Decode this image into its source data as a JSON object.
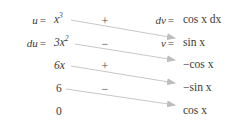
{
  "diagram": {
    "type": "integration-by-parts-table",
    "arrow_count": 4,
    "arrow_color": "#b9b9b9",
    "text_color": "#3a3a3a",
    "background": "#ffffff"
  },
  "labels": {
    "u": "u",
    "du": "du",
    "dv": "dv",
    "v": "v",
    "equals": "="
  },
  "derivative_column": {
    "header_label": "u",
    "entries": [
      {
        "text": "x",
        "exponent": "3",
        "display": "x³"
      },
      {
        "text": "3x",
        "exponent": "2",
        "display": "3x²"
      },
      {
        "text": "6x",
        "exponent": "",
        "display": "6x"
      },
      {
        "text": "6",
        "exponent": "",
        "display": "6"
      },
      {
        "text": "0",
        "exponent": "",
        "display": "0"
      }
    ]
  },
  "integral_column": {
    "header_label": "dv",
    "entries": [
      {
        "display": "cos x dx",
        "func": "cos",
        "var": "x",
        "diff": "dx",
        "sign": ""
      },
      {
        "display": "sin x",
        "func": "sin",
        "var": "x",
        "diff": "",
        "sign": ""
      },
      {
        "display": "−cos x",
        "func": "cos",
        "var": "x",
        "diff": "",
        "sign": "−"
      },
      {
        "display": "−sin x",
        "func": "sin",
        "var": "x",
        "diff": "",
        "sign": "−"
      },
      {
        "display": "cos x",
        "func": "cos",
        "var": "x",
        "diff": "",
        "sign": ""
      }
    ]
  },
  "sign_column": {
    "entries": [
      "+",
      "−",
      "+",
      "−"
    ]
  }
}
